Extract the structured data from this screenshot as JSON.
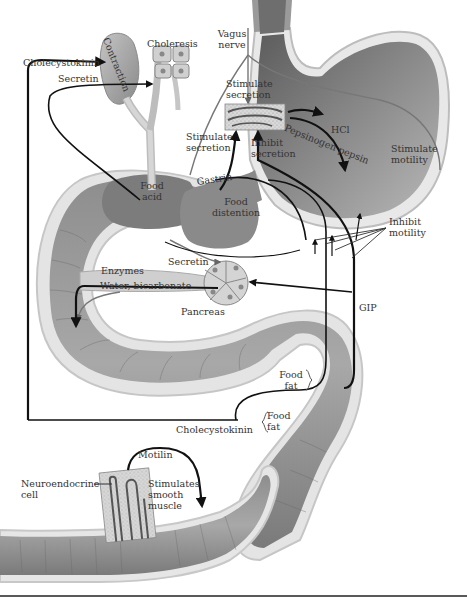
{
  "diagram": {
    "labels": {
      "cholecystokinin_top": "Cholecystokinin",
      "secretin_top": "Secretin",
      "contraction": "Contraction",
      "choleresis": "Choleresis",
      "vagus_line1": "Vagus",
      "vagus_line2": "nerve",
      "stim_sec_top_1": "Stimulate",
      "stim_sec_top_2": "secretion",
      "hcl": "HCl",
      "pepsinogen_pepsin": "Pepsinogen pepsin",
      "stimulate_motility_1": "Stimulate",
      "stimulate_motility_2": "motility",
      "stim_sec_left_1": "Stimulate",
      "stim_sec_left_2": "secretion",
      "inhibit_sec_1": "Inhibit",
      "inhibit_sec_2": "secretion",
      "gastrin": "Gastrin",
      "food_acid_1": "Food",
      "food_acid_2": "acid",
      "food_distention_1": "Food",
      "food_distention_2": "distention",
      "inhibit_motility_1": "Inhibit",
      "inhibit_motility_2": "motility",
      "secretin_mid": "Secretin",
      "enzymes": "Enzymes",
      "water_bicarbonate": "Water, bicarbonate",
      "pancreas": "Pancreas",
      "gip": "GIP",
      "food_fat_upper_1": "Food",
      "food_fat_upper_2": "fat",
      "food_fat_lower_1": "Food",
      "food_fat_lower_2": "fat",
      "cholecystokinin_bottom": "Cholecystokinin",
      "motilin": "Motilin",
      "neuroendocrine_1": "Neuroendocrine",
      "neuroendocrine_2": "cell",
      "stimulates_1": "Stimulates",
      "stimulates_2": "smooth",
      "stimulates_3": "muscle"
    },
    "colors": {
      "organ_dark": "#6e6e6e",
      "organ_mid": "#9a9a9a",
      "organ_light": "#d2d2d2",
      "arrow": "#111111",
      "text": "#333333"
    }
  }
}
